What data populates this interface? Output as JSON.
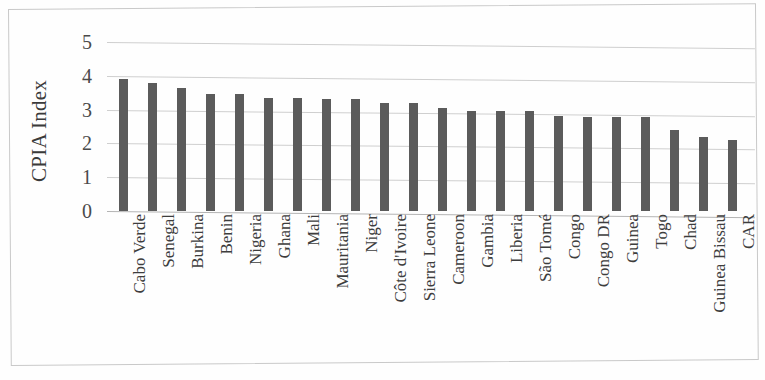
{
  "chart_data": {
    "type": "bar",
    "title": "",
    "subtitle": "",
    "xlabel": "",
    "ylabel": "CPIA Index",
    "ylim": [
      0,
      5
    ],
    "ytick_labels": [
      "5",
      "4",
      "3",
      "2",
      "1",
      "0"
    ],
    "ytick_values": [
      5,
      4,
      3,
      2,
      1,
      0
    ],
    "grid": true,
    "legend": "none",
    "orientation": "vertical",
    "bar_color": "#5b5b5b",
    "gridline_color": "#cfcfcf",
    "categories": [
      "Cabo Verde",
      "Senegal",
      "Burkina",
      "Benin",
      "Nigeria",
      "Ghana",
      "Mali",
      "Mauritania",
      "Niger",
      "Côte d'Ivoire",
      "Sierra Leone",
      "Cameroon",
      "Gambia",
      "Liberia",
      "São Tomé",
      "Congo",
      "Congo DR",
      "Guinea",
      "Togo",
      "Chad",
      "Guinea Bissau",
      "CAR"
    ],
    "values": [
      3.9,
      3.8,
      3.65,
      3.45,
      3.45,
      3.35,
      3.35,
      3.3,
      3.3,
      3.2,
      3.2,
      3.05,
      2.95,
      2.95,
      2.95,
      2.8,
      2.78,
      2.78,
      2.78,
      2.4,
      2.2,
      2.1
    ]
  }
}
